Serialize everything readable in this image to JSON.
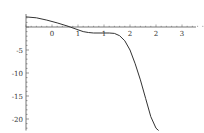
{
  "chart_data": {
    "type": "line",
    "title": "",
    "xlabel": "",
    "ylabel": "",
    "xlim": [
      -0.5,
      3.2
    ],
    "ylim": [
      -22.5,
      3
    ],
    "grid": false,
    "legend": null,
    "x_ticks": [
      0,
      0.5,
      1,
      1.5,
      2,
      2.5,
      3
    ],
    "x_tick_labels": [
      "0",
      "1",
      "1",
      "2",
      "2",
      "3"
    ],
    "y_ticks": [
      -5,
      -10,
      -15,
      -20
    ],
    "y_tick_labels": [
      "-5",
      "-10",
      "-15",
      "-20"
    ],
    "series": [
      {
        "name": "f(x)",
        "color": "#333333",
        "x": [
          -0.5,
          -0.3,
          -0.1,
          0.1,
          0.3,
          0.35,
          0.5,
          0.6,
          0.7,
          0.8,
          1.0,
          1.1,
          1.2,
          1.3,
          1.4,
          1.5,
          1.6,
          1.7,
          1.8,
          1.9,
          2.0,
          2.05
        ],
        "y": [
          2.2,
          2.0,
          1.5,
          0.9,
          0.2,
          0.0,
          -0.6,
          -1.0,
          -1.2,
          -1.3,
          -1.3,
          -1.3,
          -1.4,
          -1.9,
          -3.0,
          -5.0,
          -8.0,
          -11.5,
          -15.5,
          -19.5,
          -22.0,
          -22.5
        ]
      }
    ]
  }
}
